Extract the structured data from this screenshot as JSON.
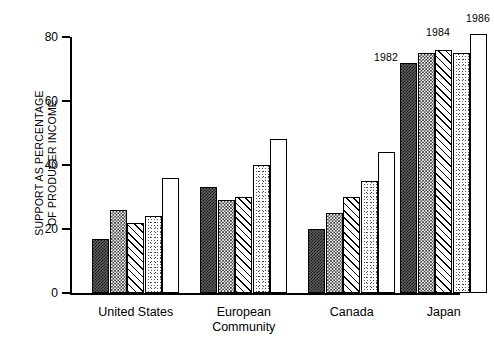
{
  "chart_data": {
    "type": "bar",
    "title": "",
    "xlabel": "",
    "ylabel": "SUPPORT AS PERCENTAGE\nOF PRODUCER INCOME",
    "ylim": [
      0,
      80
    ],
    "yticks": [
      0,
      20,
      40,
      60,
      80
    ],
    "grid": false,
    "legend_position": "none",
    "categories": [
      "United States",
      "European\nCommunity",
      "Canada",
      "Japan"
    ],
    "series": [
      {
        "name": "1982",
        "pattern": "dark-checker",
        "values": [
          17,
          33,
          20,
          72
        ]
      },
      {
        "name": "1983",
        "pattern": "checker",
        "values": [
          26,
          29,
          25,
          75
        ]
      },
      {
        "name": "1984",
        "pattern": "diagonal",
        "values": [
          22,
          30,
          30,
          76
        ]
      },
      {
        "name": "1985",
        "pattern": "stipple",
        "values": [
          24,
          40,
          35,
          75
        ]
      },
      {
        "name": "1986",
        "pattern": "white",
        "values": [
          36,
          48,
          44,
          81
        ]
      }
    ],
    "annotations": [
      {
        "text": "1982",
        "note": "left of first Japan bar"
      },
      {
        "text": "1984",
        "note": "above third Japan bar"
      },
      {
        "text": "1986",
        "note": "above fifth Japan bar"
      }
    ]
  },
  "axis": {
    "tick_labels": [
      "80",
      "60",
      "40",
      "20",
      "0"
    ]
  },
  "colors": {
    "foreground": "#000000",
    "background": "#ffffff",
    "dark_fill": "#5f5f5f"
  }
}
